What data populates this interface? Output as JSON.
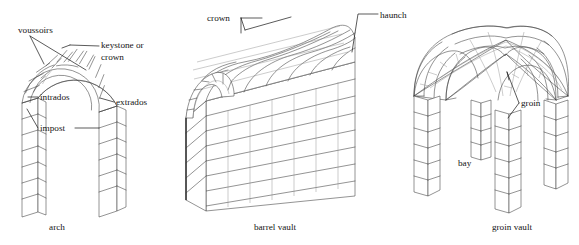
{
  "figure": {
    "background_color": "#ffffff",
    "line_color": "#3a3a3a",
    "text_color": "#141414",
    "width": 579,
    "height": 245
  },
  "panels": [
    {
      "id": "arch",
      "caption": "arch",
      "caption_x": 57,
      "caption_y": 230,
      "labels": [
        {
          "id": "voussoirs",
          "text": "voussoirs",
          "x": 18,
          "y": 33,
          "anchor": "start"
        },
        {
          "id": "keystone-crown-1",
          "text": "keystone or",
          "x": 101,
          "y": 48,
          "anchor": "start"
        },
        {
          "id": "keystone-crown-2",
          "text": "crown",
          "x": 101,
          "y": 60,
          "anchor": "start"
        },
        {
          "id": "intrados",
          "text": "intrados",
          "x": 40,
          "y": 100,
          "anchor": "start"
        },
        {
          "id": "extrados",
          "text": "extrados",
          "x": 116,
          "y": 105,
          "anchor": "start"
        },
        {
          "id": "impost",
          "text": "impost",
          "x": 40,
          "y": 131,
          "anchor": "start"
        }
      ]
    },
    {
      "id": "barrel-vault",
      "caption": "barrel vault",
      "caption_x": 275,
      "caption_y": 230,
      "labels": [
        {
          "id": "crown",
          "text": "crown",
          "x": 207,
          "y": 21,
          "anchor": "start"
        },
        {
          "id": "haunch",
          "text": "haunch",
          "x": 380,
          "y": 18,
          "anchor": "start"
        }
      ]
    },
    {
      "id": "groin-vault",
      "caption": "groin vault",
      "caption_x": 512,
      "caption_y": 230,
      "labels": [
        {
          "id": "groin",
          "text": "groin",
          "x": 521,
          "y": 106,
          "anchor": "start"
        },
        {
          "id": "bay",
          "text": "bay",
          "x": 458,
          "y": 166,
          "anchor": "start"
        }
      ]
    }
  ]
}
